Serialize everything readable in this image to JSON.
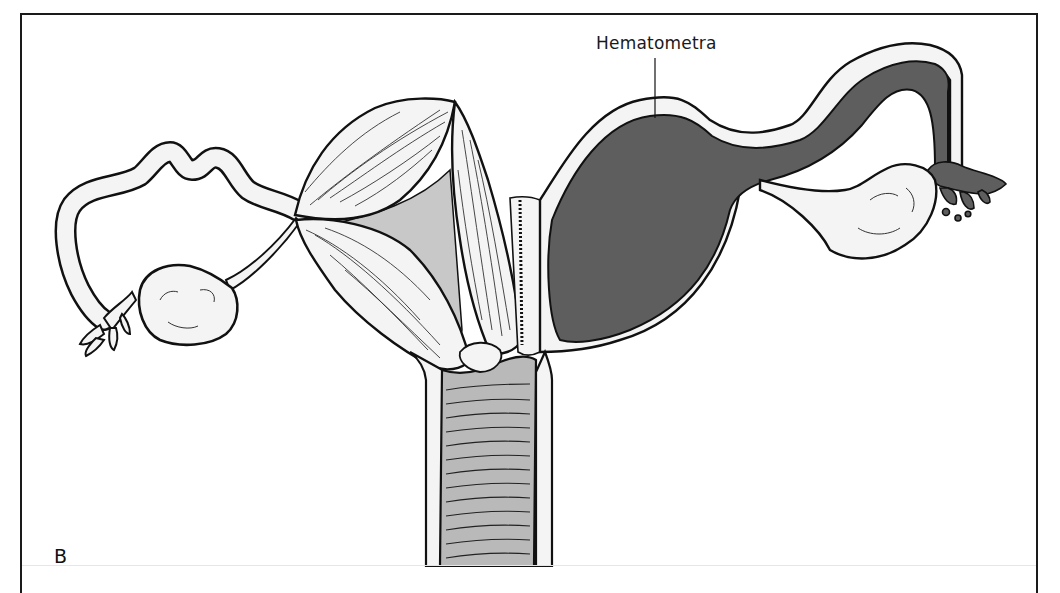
{
  "figure": {
    "panel_letter": "B",
    "callouts": [
      {
        "label": "Hematometra",
        "target": "distended-uterine-horn"
      }
    ],
    "colors": {
      "outline": "#111111",
      "tissue_light": "#f4f4f4",
      "tissue_mid": "#c8c8c8",
      "vagina_fill": "#b9b9b9",
      "hematometra_fill": "#5e5e5e",
      "frame": "#1a1a1a"
    }
  }
}
